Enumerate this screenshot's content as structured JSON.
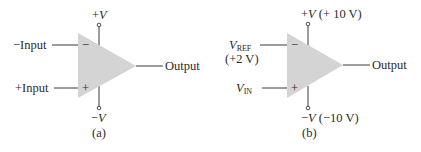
{
  "diagram": {
    "type": "op-amp schematic symbols",
    "colors": {
      "triangle_fill": "#d4d4d4",
      "line": "#3a3a3a",
      "text": "#2a2a2a",
      "background": "#ffffff"
    },
    "panels": [
      {
        "id": "a",
        "caption": "(a)",
        "supply_positive": {
          "sign": "+",
          "symbol": "V",
          "value": ""
        },
        "supply_negative": {
          "sign": "−",
          "symbol": "V",
          "value": ""
        },
        "inverting_input": {
          "label": "−Input",
          "pin_sign": "−"
        },
        "noninverting_input": {
          "label": "+Input",
          "pin_sign": "+"
        },
        "output": {
          "label": "Output"
        }
      },
      {
        "id": "b",
        "caption": "(b)",
        "supply_positive": {
          "sign": "+",
          "symbol": "V",
          "value": " (+ 10 V)"
        },
        "supply_negative": {
          "sign": "−",
          "symbol": "V",
          "value": " (−10 V)"
        },
        "inverting_input": {
          "symbol": "V",
          "subscript": "REF",
          "value": "(+2 V)",
          "pin_sign": "−"
        },
        "noninverting_input": {
          "symbol": "V",
          "subscript": "IN",
          "pin_sign": "+"
        },
        "output": {
          "label": "Output"
        }
      }
    ]
  }
}
